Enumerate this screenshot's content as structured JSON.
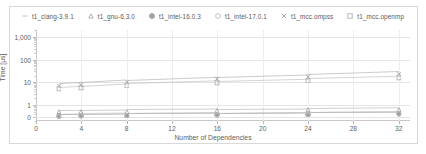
{
  "chart_data": {
    "type": "scatter",
    "title": "",
    "xlabel": "Number of Dependencies",
    "ylabel": "Time [µs]",
    "yscale": "log",
    "xlim": [
      0,
      33
    ],
    "ylim": [
      0.2,
      2000
    ],
    "grid": true,
    "legend_position": "top",
    "x_ticks": [
      "0",
      "4",
      "8",
      "12",
      "16",
      "20",
      "24",
      "28",
      "32"
    ],
    "x_tick_values": [
      0,
      4,
      8,
      12,
      16,
      20,
      24,
      28,
      32
    ],
    "y_ticks": [
      "1,000",
      "100",
      "10",
      "1",
      "0"
    ],
    "y_tick_values": [
      1000,
      100,
      10,
      1,
      0.3
    ],
    "x": [
      2,
      4,
      8,
      16,
      24,
      32
    ],
    "series": [
      {
        "name": "t1_clang-3.9.1",
        "marker": "dash",
        "color": "#b9b9b9",
        "values": [
          0.42,
          0.43,
          0.45,
          0.47,
          0.5,
          0.52
        ]
      },
      {
        "name": "t1_gnu-6.3.0",
        "marker": "triangle",
        "color": "#a8a8a8",
        "values": [
          0.62,
          0.63,
          0.66,
          0.7,
          0.74,
          0.8
        ]
      },
      {
        "name": "t1_intel-16.0.3",
        "marker": "circle-solid",
        "color": "#9e9e9e",
        "values": [
          0.41,
          0.42,
          0.44,
          0.46,
          0.49,
          0.51
        ]
      },
      {
        "name": "t1_intel-17.0.1",
        "marker": "circle-open",
        "color": "#bdbdbd",
        "values": [
          0.4,
          0.41,
          0.43,
          0.45,
          0.48,
          0.5
        ]
      },
      {
        "name": "t1_mcc.ompss",
        "marker": "cross",
        "color": "#a0a0a0",
        "values": [
          9.0,
          10.0,
          13.0,
          18.0,
          23.0,
          31.0
        ]
      },
      {
        "name": "t1_mcc.openmp",
        "marker": "square-open",
        "color": "#b0b0b0",
        "values": [
          6.2,
          7.0,
          9.0,
          12.0,
          15.0,
          19.0
        ]
      }
    ]
  },
  "legend": {
    "items": [
      {
        "label": "t1_clang-3.9.1",
        "marker": "dash-marker"
      },
      {
        "label": "t1_gnu-6.3.0",
        "marker": "triangle-marker"
      },
      {
        "label": "t1_intel-16.0.3",
        "marker": "circle-solid-marker"
      },
      {
        "label": "t1_intel-17.0.1",
        "marker": "circle-open-marker"
      },
      {
        "label": "t1_mcc.ompss",
        "marker": "cross-marker"
      },
      {
        "label": "t1_mcc.openmp",
        "marker": "square-open-marker"
      }
    ]
  },
  "colors": {
    "grid": "#e4e4e4",
    "axis": "#c8c8c8",
    "text": "#5e5e5e",
    "frame": "#d9d9d9"
  }
}
